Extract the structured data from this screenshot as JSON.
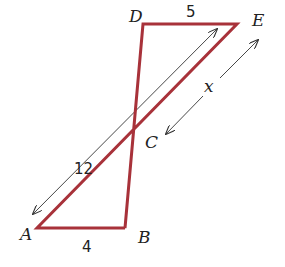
{
  "diagram": {
    "type": "geometry-figure",
    "colors": {
      "segment": "#a8323a",
      "arrow": "#333333",
      "text": "#222222"
    },
    "points": {
      "A": {
        "label": "A",
        "x": 37,
        "y": 228
      },
      "B": {
        "label": "B",
        "x": 125,
        "y": 228
      },
      "C": {
        "label": "C",
        "x": 132,
        "y": 130
      },
      "D": {
        "label": "D",
        "x": 143,
        "y": 24
      },
      "E": {
        "label": "E",
        "x": 237,
        "y": 24
      }
    },
    "segments": [
      "AB",
      "DE",
      "AE",
      "BD"
    ],
    "measures": {
      "DE": "5",
      "AB": "4",
      "AE": "12",
      "CE": "x"
    }
  }
}
